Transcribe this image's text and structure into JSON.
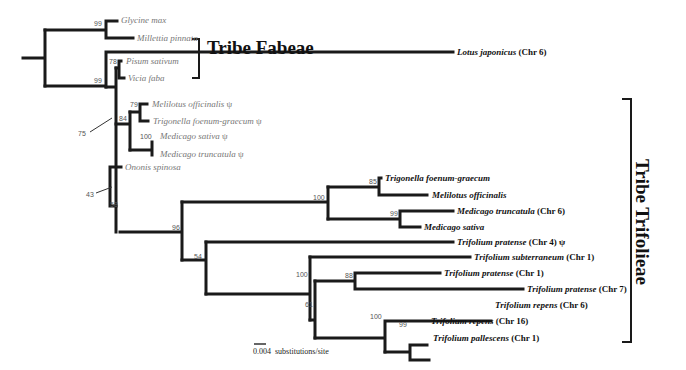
{
  "tribes": {
    "fabeae": "Tribe Fabeae",
    "trifolieae": "Tribe Trifolieae"
  },
  "taxa": [
    {
      "name": "Glycine max",
      "suffix": "",
      "group": "outgroup"
    },
    {
      "name": "Millettia pinnata",
      "suffix": "",
      "group": "outgroup"
    },
    {
      "name": "Lotus japonicus",
      "suffix": " (Chr 6)",
      "group": "trifolieae"
    },
    {
      "name": "Pisum sativum",
      "suffix": "",
      "group": "fabeae"
    },
    {
      "name": "Vicia faba",
      "suffix": "",
      "group": "fabeae"
    },
    {
      "name": "Melilotus officinalis",
      "suffix": " ψ",
      "group": "fabeae-like"
    },
    {
      "name": "Trigonella foenum-graecum",
      "suffix": " ψ",
      "group": "fabeae-like"
    },
    {
      "name": "Medicago sativa",
      "suffix": " ψ",
      "group": "fabeae-like"
    },
    {
      "name": "Medicago truncatula",
      "suffix": " ψ",
      "group": "fabeae-like"
    },
    {
      "name": "Ononis spinosa",
      "suffix": "",
      "group": "fabeae-like"
    },
    {
      "name": "Trigonella foenum-graecum",
      "suffix": "",
      "group": "trifolieae"
    },
    {
      "name": "Melilotus officinalis",
      "suffix": "",
      "group": "trifolieae"
    },
    {
      "name": "Medicago truncatula",
      "suffix": " (Chr 6)",
      "group": "trifolieae"
    },
    {
      "name": "Medicago sativa",
      "suffix": "",
      "group": "trifolieae"
    },
    {
      "name": "Trifolium pratense",
      "suffix": " (Chr 4) ψ",
      "group": "trifolieae"
    },
    {
      "name": "Trifolium subterraneum",
      "suffix": " (Chr 1)",
      "group": "trifolieae"
    },
    {
      "name": "Trifolium pratense",
      "suffix": " (Chr 1)",
      "group": "trifolieae"
    },
    {
      "name": "Trifolium pratense",
      "suffix": " (Chr 7)",
      "group": "trifolieae"
    },
    {
      "name": "Trifolium repens",
      "suffix": " (Chr 6)",
      "group": "trifolieae"
    },
    {
      "name": "Trifolium repens",
      "suffix": " (Chr 16)",
      "group": "trifolieae"
    },
    {
      "name": "Trifolium pallescens",
      "suffix": " (Chr 1)",
      "group": "trifolieae"
    }
  ],
  "bootstrap": [
    "99",
    "99",
    "78",
    "79",
    "84",
    "100",
    "75",
    "43",
    "58",
    "96",
    "100",
    "85",
    "99",
    "54",
    "100",
    "88",
    "61",
    "100",
    "99"
  ],
  "scale_bar": {
    "value": "0.004",
    "unit": "substitutions/site"
  }
}
